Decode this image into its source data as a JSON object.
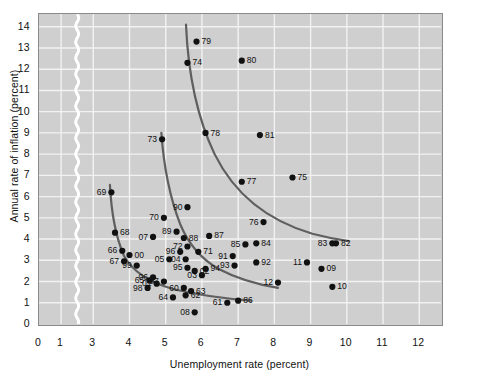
{
  "chart_data": {
    "type": "scatter",
    "title": "",
    "xlabel": "Unemployment rate (percent)",
    "ylabel": "Annual rate of inflation (percent)",
    "xlim": [
      0,
      12.6
    ],
    "ylim": [
      0,
      14.6
    ],
    "xticks": [
      0,
      1,
      3,
      4,
      5,
      6,
      7,
      8,
      9,
      10,
      11,
      12
    ],
    "yticks": [
      0,
      1,
      2,
      3,
      4,
      5,
      6,
      7,
      8,
      9,
      10,
      11,
      12,
      13,
      14
    ],
    "grid": true,
    "legend": "none",
    "axis_break": {
      "axis": "x",
      "between": [
        1,
        3
      ],
      "style": "wavy-white"
    },
    "points": [
      {
        "label": "61",
        "x": 6.7,
        "y": 1.0
      },
      {
        "label": "62",
        "x": 5.55,
        "y": 1.35
      },
      {
        "label": "63",
        "x": 5.7,
        "y": 1.55
      },
      {
        "label": "64",
        "x": 5.2,
        "y": 1.25
      },
      {
        "label": "65",
        "x": 4.55,
        "y": 2.05
      },
      {
        "label": "66",
        "x": 3.8,
        "y": 3.45
      },
      {
        "label": "67",
        "x": 3.85,
        "y": 2.95
      },
      {
        "label": "68",
        "x": 3.6,
        "y": 4.3
      },
      {
        "label": "69",
        "x": 3.5,
        "y": 6.2
      },
      {
        "label": "60",
        "x": 5.5,
        "y": 1.7
      },
      {
        "label": "70",
        "x": 4.95,
        "y": 5.0
      },
      {
        "label": "71",
        "x": 5.9,
        "y": 3.4
      },
      {
        "label": "72",
        "x": 5.6,
        "y": 3.65
      },
      {
        "label": "73",
        "x": 4.9,
        "y": 8.7
      },
      {
        "label": "74",
        "x": 5.6,
        "y": 12.3
      },
      {
        "label": "75",
        "x": 8.5,
        "y": 6.9
      },
      {
        "label": "76",
        "x": 7.7,
        "y": 4.8
      },
      {
        "label": "77",
        "x": 7.1,
        "y": 6.7
      },
      {
        "label": "78",
        "x": 6.1,
        "y": 9.0
      },
      {
        "label": "79",
        "x": 5.85,
        "y": 13.3
      },
      {
        "label": "80",
        "x": 7.1,
        "y": 12.4
      },
      {
        "label": "81",
        "x": 7.6,
        "y": 8.9
      },
      {
        "label": "82",
        "x": 9.7,
        "y": 3.8
      },
      {
        "label": "83",
        "x": 9.6,
        "y": 3.8
      },
      {
        "label": "84",
        "x": 7.5,
        "y": 3.8
      },
      {
        "label": "85",
        "x": 7.2,
        "y": 3.75
      },
      {
        "label": "86",
        "x": 7.0,
        "y": 1.1
      },
      {
        "label": "87",
        "x": 6.2,
        "y": 4.15
      },
      {
        "label": "88",
        "x": 5.5,
        "y": 4.05
      },
      {
        "label": "89",
        "x": 5.3,
        "y": 4.35
      },
      {
        "label": "90",
        "x": 5.6,
        "y": 5.5
      },
      {
        "label": "91",
        "x": 6.85,
        "y": 3.2
      },
      {
        "label": "92",
        "x": 7.5,
        "y": 2.9
      },
      {
        "label": "93",
        "x": 6.9,
        "y": 2.75
      },
      {
        "label": "94",
        "x": 6.1,
        "y": 2.6
      },
      {
        "label": "95",
        "x": 5.6,
        "y": 2.65
      },
      {
        "label": "96",
        "x": 5.4,
        "y": 3.4
      },
      {
        "label": "97",
        "x": 4.95,
        "y": 2.0
      },
      {
        "label": "98",
        "x": 4.5,
        "y": 1.7
      },
      {
        "label": "99",
        "x": 4.2,
        "y": 2.75
      },
      {
        "label": "00",
        "x": 4.0,
        "y": 3.25
      },
      {
        "label": "01",
        "x": 4.75,
        "y": 1.9
      },
      {
        "label": "02",
        "x": 5.8,
        "y": 2.5
      },
      {
        "label": "03",
        "x": 6.0,
        "y": 2.3
      },
      {
        "label": "04",
        "x": 5.55,
        "y": 3.05
      },
      {
        "label": "05",
        "x": 5.1,
        "y": 3.05
      },
      {
        "label": "06",
        "x": 4.65,
        "y": 2.2
      },
      {
        "label": "07",
        "x": 4.65,
        "y": 4.1
      },
      {
        "label": "08",
        "x": 5.8,
        "y": 0.55
      },
      {
        "label": "09",
        "x": 9.3,
        "y": 2.6
      },
      {
        "label": "10",
        "x": 9.6,
        "y": 1.75
      },
      {
        "label": "11",
        "x": 8.9,
        "y": 2.9
      },
      {
        "label": "12",
        "x": 8.1,
        "y": 1.95
      }
    ],
    "curves": [
      {
        "name": "phillips-curve-1960s",
        "path": "M 3.46,6.55 C 3.50,5.20 3.62,4.10 3.85,3.20 C 4.10,2.45 4.55,1.95 5.20,1.65 C 5.80,1.40 6.50,1.22 7.35,1.10"
      },
      {
        "name": "phillips-curve-1970s",
        "path": "M 4.88,9.00 C 4.95,7.30 5.15,5.80 5.40,4.70 C 5.62,3.80 5.95,3.10 6.45,2.60 C 6.95,2.15 7.55,1.85 8.10,1.70"
      },
      {
        "name": "phillips-curve-late-1970s",
        "path": "M 5.56,14.10 C 5.62,11.70 5.90,9.60 6.35,8.00 C 6.90,6.10 7.85,4.85 9.05,4.25 C 9.50,4.05 9.85,3.95 10.05,3.90"
      }
    ]
  }
}
